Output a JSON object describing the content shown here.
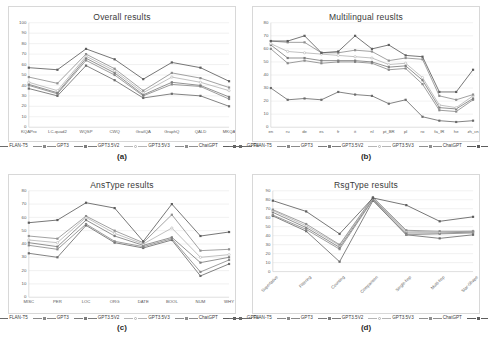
{
  "figure": {
    "name": "four-panel-line-chart-figure",
    "series_names": [
      "FLAN-T5",
      "GPT3",
      "GPT3.5V2",
      "GPT3.5V3",
      "ChatGPT",
      "GPT4"
    ],
    "series_colors": [
      "#6b6b6b",
      "#8a8a8a",
      "#7d7d7d",
      "#b5b5b5",
      "#909090",
      "#5d5d5d"
    ],
    "series_markers": [
      "square",
      "square",
      "square",
      "circle-hollow",
      "square",
      "square"
    ],
    "captions": [
      "(a)",
      "(b)",
      "(c)",
      "(d)"
    ]
  },
  "chart_data": [
    {
      "type": "line",
      "panel": "a",
      "caption": "(a)",
      "title": "Overall results",
      "xlabel": "",
      "ylabel": "",
      "ylim": [
        0,
        100
      ],
      "yticks": [
        0,
        10,
        20,
        30,
        40,
        50,
        60,
        70,
        80,
        90,
        100
      ],
      "grid": true,
      "legend_position": "bottom",
      "categories": [
        "KQAPro",
        "LC-quad2",
        "WQSP",
        "CWQ",
        "GrailQA",
        "GraphQ",
        "QALD",
        "MKQA"
      ],
      "series": [
        {
          "name": "FLAN-T5",
          "values": [
            37,
            30,
            59,
            45,
            28,
            32,
            30,
            20
          ]
        },
        {
          "name": "GPT3",
          "values": [
            40,
            32,
            64,
            50,
            30,
            41,
            39,
            27
          ]
        },
        {
          "name": "GPT3.5V2",
          "values": [
            41,
            33,
            66,
            52,
            31,
            43,
            40,
            29
          ]
        },
        {
          "name": "GPT3.5V3",
          "values": [
            43,
            35,
            68,
            54,
            33,
            48,
            43,
            35
          ]
        },
        {
          "name": "ChatGPT",
          "values": [
            48,
            42,
            70,
            56,
            35,
            52,
            47,
            38
          ]
        },
        {
          "name": "GPT4",
          "values": [
            57,
            55,
            75,
            65,
            46,
            62,
            57,
            44
          ]
        }
      ]
    },
    {
      "type": "line",
      "panel": "b",
      "caption": "(b)",
      "title": "Multilingual reuslts",
      "xlabel": "",
      "ylabel": "",
      "ylim": [
        0,
        80
      ],
      "yticks": [
        0,
        10,
        20,
        30,
        40,
        50,
        60,
        70,
        80
      ],
      "grid": true,
      "legend_position": "bottom",
      "categories": [
        "en",
        "ru",
        "de",
        "es",
        "fr",
        "it",
        "nl",
        "pt_BR",
        "pl",
        "ro",
        "fa_IR",
        "he",
        "zh_cn"
      ],
      "series": [
        {
          "name": "FLAN-T5",
          "values": [
            30,
            21,
            22,
            21,
            27,
            25,
            24,
            18,
            21,
            8,
            5,
            4,
            5
          ]
        },
        {
          "name": "GPT3",
          "values": [
            60,
            49,
            51,
            49,
            50,
            50,
            49,
            44,
            45,
            33,
            13,
            12,
            21
          ]
        },
        {
          "name": "GPT3.5V2",
          "values": [
            63,
            53,
            53,
            51,
            51,
            51,
            50,
            46,
            47,
            36,
            15,
            14,
            22
          ]
        },
        {
          "name": "GPT3.5V3",
          "values": [
            64,
            58,
            57,
            56,
            55,
            54,
            53,
            48,
            49,
            38,
            17,
            15,
            24
          ]
        },
        {
          "name": "ChatGPT",
          "values": [
            66,
            65,
            65,
            57,
            57,
            59,
            58,
            51,
            53,
            52,
            24,
            21,
            25
          ]
        },
        {
          "name": "GPT4",
          "values": [
            66,
            66,
            70,
            57,
            58,
            70,
            60,
            63,
            55,
            54,
            27,
            27,
            44
          ]
        }
      ]
    },
    {
      "type": "line",
      "panel": "c",
      "caption": "(c)",
      "title": "AnsType results",
      "xlabel": "",
      "ylabel": "",
      "ylim": [
        0,
        80
      ],
      "yticks": [
        0,
        10,
        20,
        30,
        40,
        50,
        60,
        70,
        80
      ],
      "grid": true,
      "legend_position": "bottom",
      "categories": [
        "MISC",
        "PER",
        "LOC",
        "ORG",
        "DATE",
        "BOOL",
        "NUM",
        "WHY"
      ],
      "series": [
        {
          "name": "FLAN-T5",
          "values": [
            33,
            30,
            54,
            41,
            37,
            43,
            16,
            25
          ]
        },
        {
          "name": "GPT3",
          "values": [
            39,
            36,
            55,
            42,
            38,
            44,
            19,
            28
          ]
        },
        {
          "name": "GPT3.5V2",
          "values": [
            41,
            38,
            58,
            46,
            39,
            45,
            26,
            30
          ]
        },
        {
          "name": "GPT3.5V3",
          "values": [
            43,
            41,
            60,
            48,
            40,
            52,
            30,
            32
          ]
        },
        {
          "name": "ChatGPT",
          "values": [
            46,
            44,
            61,
            50,
            41,
            62,
            35,
            36
          ]
        },
        {
          "name": "GPT4",
          "values": [
            56,
            58,
            71,
            67,
            42,
            70,
            46,
            49
          ]
        }
      ]
    },
    {
      "type": "line",
      "panel": "d",
      "caption": "(d)",
      "title": "RsgType results",
      "xlabel": "",
      "ylabel": "",
      "ylim": [
        0,
        90
      ],
      "yticks": [
        0,
        10,
        20,
        30,
        40,
        50,
        60,
        70,
        80,
        90
      ],
      "grid": true,
      "legend_position": "bottom",
      "categories": [
        "Superlative",
        "Filtering",
        "Counting",
        "Comparison",
        "Single-hop",
        "Multi-hop",
        "Star-Shape"
      ],
      "series": [
        {
          "name": "FLAN-T5",
          "values": [
            62,
            45,
            11,
            79,
            41,
            37,
            41
          ]
        },
        {
          "name": "GPT3",
          "values": [
            63,
            47,
            25,
            80,
            41,
            42,
            43
          ]
        },
        {
          "name": "GPT3.5V2",
          "values": [
            66,
            49,
            27,
            81,
            43,
            43,
            44
          ]
        },
        {
          "name": "GPT3.5V3",
          "values": [
            68,
            51,
            29,
            82,
            45,
            44,
            45
          ]
        },
        {
          "name": "ChatGPT",
          "values": [
            69,
            53,
            30,
            83,
            46,
            45,
            45
          ]
        },
        {
          "name": "GPT4",
          "values": [
            79,
            67,
            42,
            82,
            74,
            56,
            61
          ]
        }
      ]
    }
  ]
}
